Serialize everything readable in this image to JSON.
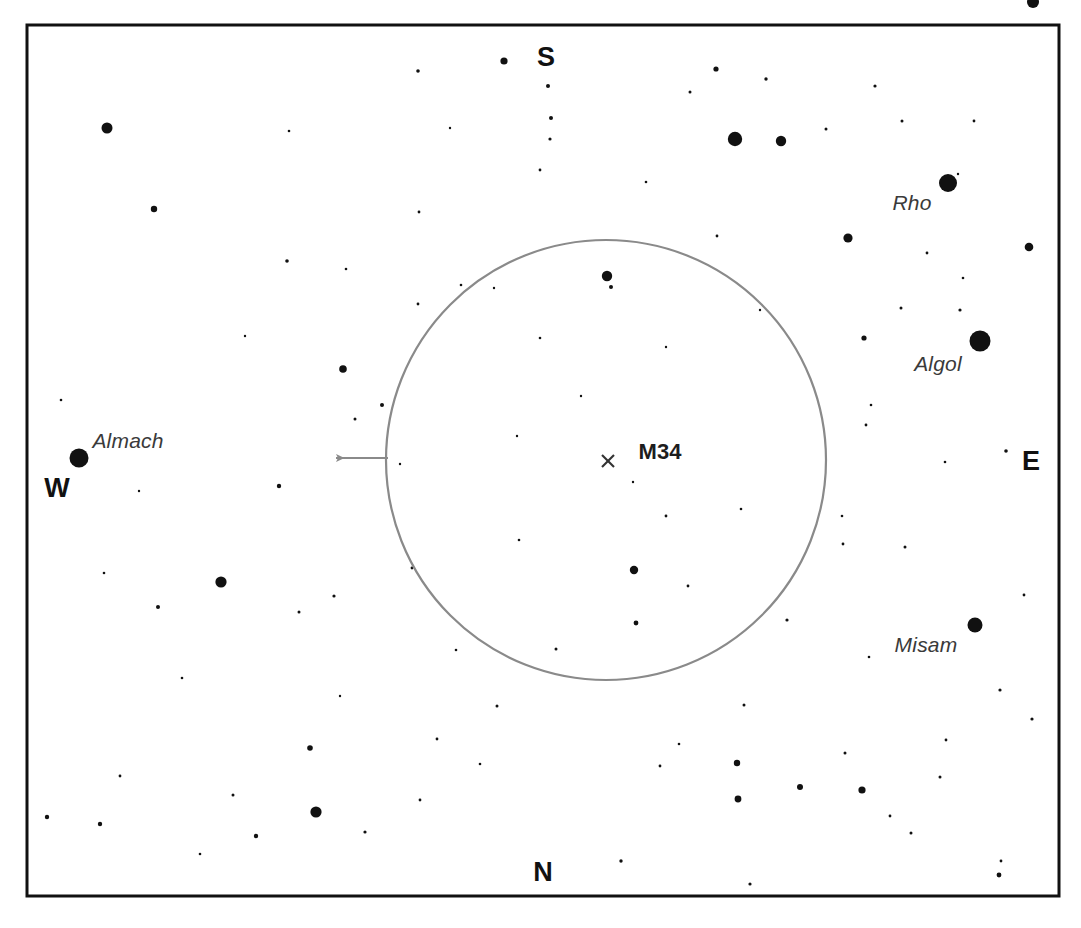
{
  "chart_data": {
    "type": "scatter",
    "title": "",
    "subtitle": "",
    "xlabel": "",
    "ylabel": "",
    "grid": false,
    "legend": "none",
    "frame": {
      "x": 27,
      "y": 25,
      "width": 1032,
      "height": 871,
      "border_color": "#111111",
      "border_width": 3
    },
    "field_circle": {
      "cx": 606,
      "cy": 460,
      "r": 220,
      "stroke": "#8a8a8a",
      "stroke_width": 2.2,
      "fill": "none"
    },
    "pointer_arrow": {
      "from_x": 388,
      "from_y": 458,
      "to_x": 333,
      "to_y": 458,
      "color": "#8a8a8a",
      "direction": "west"
    },
    "target_marker": {
      "x": 608,
      "y": 461,
      "symbol": "cross-x",
      "size": 12,
      "color": "#333333"
    },
    "xlim": [
      27,
      1059
    ],
    "ylim": [
      25,
      896
    ],
    "cardinals": [
      {
        "label": "S",
        "x": 546,
        "y": 57
      },
      {
        "label": "N",
        "x": 543,
        "y": 872
      },
      {
        "label": "E",
        "x": 1031,
        "y": 461
      },
      {
        "label": "W",
        "x": 57,
        "y": 488
      }
    ],
    "named_objects": [
      {
        "name": "M34",
        "type": "open-cluster",
        "label_x": 660,
        "label_y": 452,
        "marker_x": 608,
        "marker_y": 461
      },
      {
        "name": "Almach",
        "type": "star",
        "label_x": 128,
        "label_y": 441,
        "star_x": 79,
        "star_y": 458,
        "r": 9.5
      },
      {
        "name": "Rho",
        "type": "star",
        "label_x": 912,
        "label_y": 203,
        "star_x": 948,
        "star_y": 183,
        "r": 9.0
      },
      {
        "name": "Algol",
        "type": "star",
        "label_x": 938,
        "label_y": 364,
        "star_x": 980,
        "star_y": 341,
        "r": 10.5
      },
      {
        "name": "Misam",
        "type": "star",
        "label_x": 926,
        "label_y": 645,
        "star_x": 975,
        "star_y": 625,
        "r": 7.5
      }
    ],
    "stars": [
      {
        "x": 79,
        "y": 458,
        "r": 9.5
      },
      {
        "x": 948,
        "y": 183,
        "r": 9.0
      },
      {
        "x": 980,
        "y": 341,
        "r": 10.5
      },
      {
        "x": 975,
        "y": 625,
        "r": 7.5
      },
      {
        "x": 107,
        "y": 128,
        "r": 5.5
      },
      {
        "x": 154,
        "y": 209,
        "r": 3.2
      },
      {
        "x": 343,
        "y": 369,
        "r": 3.8
      },
      {
        "x": 221,
        "y": 582,
        "r": 5.6
      },
      {
        "x": 735,
        "y": 139,
        "r": 7.2
      },
      {
        "x": 781,
        "y": 141,
        "r": 5.2
      },
      {
        "x": 848,
        "y": 238,
        "r": 4.6
      },
      {
        "x": 1029,
        "y": 247,
        "r": 4.3
      },
      {
        "x": 1033,
        "y": 2,
        "r": 6.0
      },
      {
        "x": 864,
        "y": 338,
        "r": 2.6
      },
      {
        "x": 607,
        "y": 276,
        "r": 5.2
      },
      {
        "x": 611,
        "y": 287,
        "r": 2.0
      },
      {
        "x": 634,
        "y": 570,
        "r": 4.2
      },
      {
        "x": 636,
        "y": 623,
        "r": 2.4
      },
      {
        "x": 316,
        "y": 812,
        "r": 5.6
      },
      {
        "x": 310,
        "y": 748,
        "r": 2.8
      },
      {
        "x": 256,
        "y": 836,
        "r": 2.2
      },
      {
        "x": 800,
        "y": 787,
        "r": 3.0
      },
      {
        "x": 738,
        "y": 799,
        "r": 3.4
      },
      {
        "x": 862,
        "y": 790,
        "r": 3.6
      },
      {
        "x": 737,
        "y": 763,
        "r": 3.2
      },
      {
        "x": 100,
        "y": 824,
        "r": 2.2
      },
      {
        "x": 504,
        "y": 61,
        "r": 3.6
      },
      {
        "x": 418,
        "y": 71,
        "r": 1.8
      },
      {
        "x": 548,
        "y": 86,
        "r": 2.0
      },
      {
        "x": 716,
        "y": 69,
        "r": 2.6
      },
      {
        "x": 551,
        "y": 118,
        "r": 2.0
      },
      {
        "x": 550,
        "y": 139,
        "r": 1.6
      },
      {
        "x": 690,
        "y": 92,
        "r": 1.5
      },
      {
        "x": 766,
        "y": 79,
        "r": 1.7
      },
      {
        "x": 875,
        "y": 86,
        "r": 1.6
      },
      {
        "x": 902,
        "y": 121,
        "r": 1.5
      },
      {
        "x": 974,
        "y": 121,
        "r": 1.4
      },
      {
        "x": 540,
        "y": 170,
        "r": 1.4
      },
      {
        "x": 289,
        "y": 131,
        "r": 1.3
      },
      {
        "x": 958,
        "y": 174,
        "r": 1.2
      },
      {
        "x": 826,
        "y": 129,
        "r": 1.5
      },
      {
        "x": 287,
        "y": 261,
        "r": 1.8
      },
      {
        "x": 419,
        "y": 212,
        "r": 1.4
      },
      {
        "x": 418,
        "y": 304,
        "r": 1.4
      },
      {
        "x": 461,
        "y": 285,
        "r": 1.3
      },
      {
        "x": 494,
        "y": 288,
        "r": 1.2
      },
      {
        "x": 382,
        "y": 405,
        "r": 2.0
      },
      {
        "x": 279,
        "y": 486,
        "r": 2.2
      },
      {
        "x": 158,
        "y": 607,
        "r": 2.0
      },
      {
        "x": 334,
        "y": 596,
        "r": 1.6
      },
      {
        "x": 299,
        "y": 612,
        "r": 1.5
      },
      {
        "x": 412,
        "y": 568,
        "r": 1.4
      },
      {
        "x": 456,
        "y": 650,
        "r": 1.3
      },
      {
        "x": 497,
        "y": 706,
        "r": 1.5
      },
      {
        "x": 437,
        "y": 739,
        "r": 1.4
      },
      {
        "x": 621,
        "y": 861,
        "r": 1.7
      },
      {
        "x": 750,
        "y": 884,
        "r": 1.6
      },
      {
        "x": 911,
        "y": 833,
        "r": 1.5
      },
      {
        "x": 999,
        "y": 875,
        "r": 2.4
      },
      {
        "x": 1001,
        "y": 861,
        "r": 1.4
      },
      {
        "x": 1000,
        "y": 690,
        "r": 1.6
      },
      {
        "x": 1006,
        "y": 451,
        "r": 1.8
      },
      {
        "x": 1032,
        "y": 719,
        "r": 1.6
      },
      {
        "x": 946,
        "y": 740,
        "r": 1.4
      },
      {
        "x": 940,
        "y": 777,
        "r": 1.5
      },
      {
        "x": 890,
        "y": 816,
        "r": 1.4
      },
      {
        "x": 845,
        "y": 753,
        "r": 1.5
      },
      {
        "x": 744,
        "y": 705,
        "r": 1.5
      },
      {
        "x": 787,
        "y": 620,
        "r": 1.6
      },
      {
        "x": 843,
        "y": 544,
        "r": 1.4
      },
      {
        "x": 842,
        "y": 516,
        "r": 1.3
      },
      {
        "x": 905,
        "y": 547,
        "r": 1.5
      },
      {
        "x": 866,
        "y": 425,
        "r": 1.4
      },
      {
        "x": 945,
        "y": 462,
        "r": 1.3
      },
      {
        "x": 901,
        "y": 308,
        "r": 1.5
      },
      {
        "x": 871,
        "y": 405,
        "r": 1.3
      },
      {
        "x": 960,
        "y": 310,
        "r": 1.6
      },
      {
        "x": 963,
        "y": 278,
        "r": 1.3
      },
      {
        "x": 927,
        "y": 253,
        "r": 1.4
      },
      {
        "x": 666,
        "y": 516,
        "r": 1.4
      },
      {
        "x": 633,
        "y": 482,
        "r": 1.2
      },
      {
        "x": 519,
        "y": 540,
        "r": 1.3
      },
      {
        "x": 688,
        "y": 586,
        "r": 1.4
      },
      {
        "x": 517,
        "y": 436,
        "r": 1.2
      },
      {
        "x": 540,
        "y": 338,
        "r": 1.3
      },
      {
        "x": 556,
        "y": 649,
        "r": 1.5
      },
      {
        "x": 741,
        "y": 509,
        "r": 1.3
      },
      {
        "x": 400,
        "y": 464,
        "r": 1.2
      },
      {
        "x": 355,
        "y": 419,
        "r": 1.5
      },
      {
        "x": 61,
        "y": 400,
        "r": 1.3
      },
      {
        "x": 120,
        "y": 776,
        "r": 1.4
      },
      {
        "x": 47,
        "y": 817,
        "r": 2.2
      },
      {
        "x": 233,
        "y": 795,
        "r": 1.5
      },
      {
        "x": 365,
        "y": 832,
        "r": 1.6
      },
      {
        "x": 420,
        "y": 800,
        "r": 1.4
      },
      {
        "x": 200,
        "y": 854,
        "r": 1.3
      },
      {
        "x": 480,
        "y": 764,
        "r": 1.3
      },
      {
        "x": 660,
        "y": 766,
        "r": 1.4
      },
      {
        "x": 679,
        "y": 744,
        "r": 1.3
      },
      {
        "x": 104,
        "y": 573,
        "r": 1.3
      },
      {
        "x": 182,
        "y": 678,
        "r": 1.3
      },
      {
        "x": 340,
        "y": 696,
        "r": 1.2
      },
      {
        "x": 717,
        "y": 236,
        "r": 1.4
      },
      {
        "x": 646,
        "y": 182,
        "r": 1.3
      },
      {
        "x": 760,
        "y": 310,
        "r": 1.2
      },
      {
        "x": 666,
        "y": 347,
        "r": 1.2
      },
      {
        "x": 581,
        "y": 396,
        "r": 1.2
      },
      {
        "x": 450,
        "y": 128,
        "r": 1.2
      },
      {
        "x": 346,
        "y": 269,
        "r": 1.3
      },
      {
        "x": 245,
        "y": 336,
        "r": 1.2
      },
      {
        "x": 139,
        "y": 491,
        "r": 1.2
      },
      {
        "x": 869,
        "y": 657,
        "r": 1.3
      },
      {
        "x": 1024,
        "y": 595,
        "r": 1.4
      }
    ]
  },
  "labels": {
    "m34": "M34",
    "almach": "Almach",
    "rho": "Rho",
    "algol": "Algol",
    "misam": "Misam",
    "north": "N",
    "south": "S",
    "east": "E",
    "west": "W"
  },
  "colors": {
    "background": "#ffffff",
    "frame": "#111111",
    "star": "#111111",
    "field_circle": "#8a8a8a",
    "arrow": "#8a8a8a",
    "label_text": "#3a3a3a",
    "cardinal_text": "#111111"
  }
}
